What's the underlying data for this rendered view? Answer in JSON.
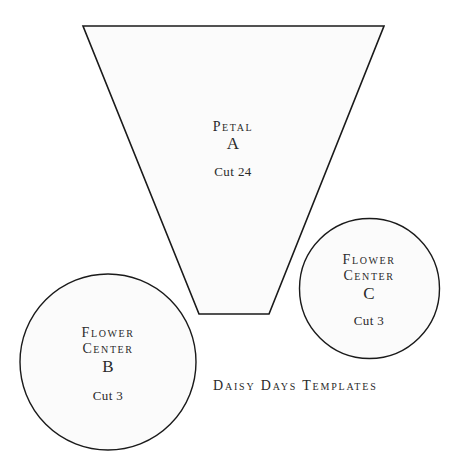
{
  "title": "Daisy Days Templates",
  "colors": {
    "outline": "#1a1a1a",
    "fill": "#fbfbfb",
    "text": "#2a2a2a",
    "background": "#ffffff"
  },
  "shapes": {
    "petal": {
      "name": "Petal",
      "letter": "A",
      "cut": "Cut 24",
      "shape": "trapezoid"
    },
    "center_b": {
      "name_line1": "Flower",
      "name_line2": "Center",
      "letter": "B",
      "cut": "Cut 3",
      "shape": "circle"
    },
    "center_c": {
      "name_line1": "Flower",
      "name_line2": "Center",
      "letter": "C",
      "cut": "Cut 3",
      "shape": "circle"
    }
  }
}
